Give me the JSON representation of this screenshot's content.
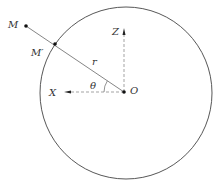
{
  "diagram": {
    "labels": {
      "M": "M",
      "M_prime": "M′",
      "r": "r",
      "theta": "θ",
      "O": "O",
      "X": "X",
      "Z": "Z"
    },
    "colors": {
      "circle": "#444444",
      "axis": "#888888",
      "line": "#777777",
      "point": "#111111"
    }
  }
}
